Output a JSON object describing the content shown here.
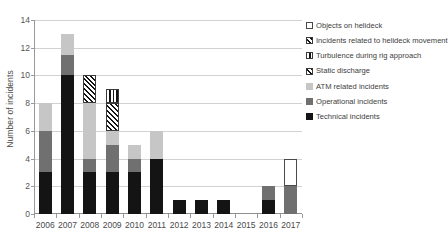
{
  "chart_data": {
    "type": "bar",
    "stacked": true,
    "title": "",
    "xlabel": "",
    "ylabel": "Number of incidents",
    "ylim": [
      0,
      14
    ],
    "ytick_step": 2,
    "ytick_labels": [
      "0",
      "2",
      "4",
      "6",
      "8",
      "10",
      "12",
      "14"
    ],
    "grid": true,
    "legend_position": "right",
    "categories": [
      "2006",
      "2007",
      "2008",
      "2009",
      "2010",
      "2011",
      "2012",
      "2013",
      "2014",
      "2015",
      "2016",
      "2017"
    ],
    "series": [
      {
        "name": "Technical incidents",
        "key": "technical",
        "color": "#141414",
        "pattern": "solid",
        "values": [
          3,
          10,
          3,
          3,
          3,
          4,
          1,
          1,
          1,
          0,
          1,
          0
        ]
      },
      {
        "name": "Operational incidents",
        "key": "operational",
        "color": "#707070",
        "pattern": "solid",
        "values": [
          3,
          1.5,
          1,
          2,
          1,
          0,
          0,
          0,
          0,
          0,
          1,
          2
        ]
      },
      {
        "name": "ATM related incidents",
        "key": "atm",
        "color": "#c6c6c6",
        "pattern": "solid",
        "values": [
          2,
          1.5,
          4,
          1,
          1,
          2,
          0,
          0,
          0,
          0,
          0,
          0
        ]
      },
      {
        "name": "Static discharge",
        "key": "static",
        "color": "#141414",
        "pattern": "diagonal-hatch",
        "values": [
          0,
          0,
          0,
          2,
          0,
          0,
          0,
          0,
          0,
          0,
          0,
          0
        ]
      },
      {
        "name": "Turbulence during rig approach",
        "key": "turbulence",
        "color": "#141414",
        "pattern": "vertical-lines",
        "values": [
          0,
          0,
          0,
          1,
          0,
          0,
          0,
          0,
          0,
          0,
          0,
          0
        ]
      },
      {
        "name": "Incidents related to helideck movement",
        "key": "helideck-move",
        "color": "#141414",
        "pattern": "cross-hatch",
        "values": [
          0,
          0,
          2,
          0,
          0,
          0,
          0,
          0,
          0,
          0,
          0,
          0
        ]
      },
      {
        "name": "Objects on helideck",
        "key": "objects",
        "color": "#ffffff",
        "pattern": "outline",
        "values": [
          0,
          0,
          0,
          0,
          0,
          0,
          0,
          0,
          0,
          0,
          0,
          2
        ]
      }
    ],
    "totals": [
      8,
      13,
      10,
      9,
      5,
      6,
      1,
      1,
      1,
      0,
      2,
      4
    ]
  },
  "legend": {
    "entries": [
      {
        "label": "Objects on helideck",
        "key": "objects"
      },
      {
        "label": "Incidents related to helideck movement",
        "key": "helideck-move"
      },
      {
        "label": "Turbulence during rig approach",
        "key": "turbulence"
      },
      {
        "label": "Static discharge",
        "key": "static"
      },
      {
        "label": "ATM related incidents",
        "key": "atm"
      },
      {
        "label": "Operational incidents",
        "key": "operational"
      },
      {
        "label": "Technical incidents",
        "key": "technical"
      }
    ]
  }
}
